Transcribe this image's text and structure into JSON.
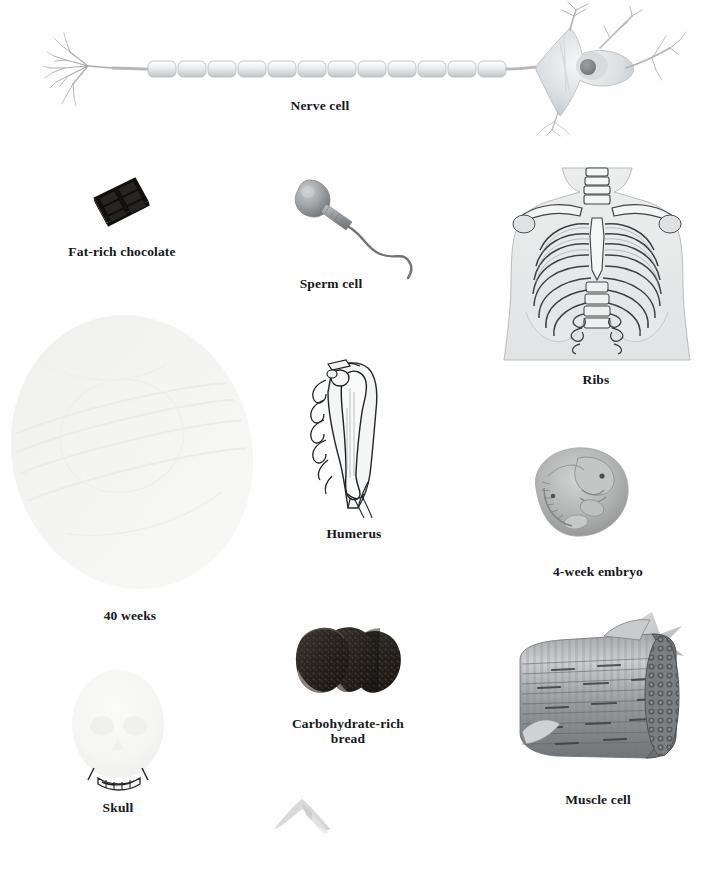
{
  "page": {
    "background_color": "#fefefe",
    "width": 708,
    "height": 878,
    "caption_color": "#15171b"
  },
  "figures": [
    {
      "id": "nerve-cell",
      "name": "nerve-cell-illustration",
      "caption": "Nerve cell",
      "caption_lines": [
        "Nerve cell"
      ],
      "subject": "myelinated neuron with dendrites, axon and soma",
      "color": "#b9bcc0"
    },
    {
      "id": "chocolate",
      "name": "fat-rich-chocolate-illustration",
      "caption": "Fat-rich chocolate",
      "caption_lines": [
        "Fat-rich chocolate"
      ],
      "subject": "dark chocolate bar of six squares",
      "color": "#1c1a19"
    },
    {
      "id": "sperm",
      "name": "sperm-cell-illustration",
      "caption": "Sperm cell",
      "caption_lines": [
        "Sperm cell"
      ],
      "subject": "spermatozoon with head, midpiece and flagellum",
      "color": "#8d9094"
    },
    {
      "id": "ribs",
      "name": "ribs-illustration",
      "caption": "Ribs",
      "caption_lines": [
        "Ribs"
      ],
      "subject": "anterior view of human rib cage and thorax",
      "color": "#6f7377"
    },
    {
      "id": "fetus40",
      "name": "forty-weeks-fetus-illustration",
      "caption": "40 weeks",
      "caption_lines": [
        "40 weeks"
      ],
      "subject": "faint full-term fetus in uterus, very light grey oval",
      "color": "#f2f2f1"
    },
    {
      "id": "humerus",
      "name": "humerus-illustration",
      "caption": "Humerus",
      "caption_lines": [
        "Humerus"
      ],
      "subject": "upper arm bone within arm outline",
      "color": "#3a3c3f"
    },
    {
      "id": "embryo",
      "name": "four-week-embryo-illustration",
      "caption": "4-week embryo",
      "caption_lines": [
        "4-week embryo"
      ],
      "subject": "curled four week old human embryo",
      "color": "#9a9c9d"
    },
    {
      "id": "skull",
      "name": "skull-illustration",
      "caption": "Skull",
      "caption_lines": [
        "Skull"
      ],
      "subject": "faint human skull, pale oval with dark teeth at base",
      "color": "#f4f4f3"
    },
    {
      "id": "bread",
      "name": "carbohydrate-rich-bread-illustration",
      "caption": "Carbohydrate-rich\nbread",
      "caption_lines": [
        "Carbohydrate-rich",
        "bread"
      ],
      "subject": "three dark slices of rye bread",
      "color": "#2a2724"
    },
    {
      "id": "muscle",
      "name": "muscle-cell-illustration",
      "caption": "Muscle cell",
      "caption_lines": [
        "Muscle cell"
      ],
      "subject": "cut-away cylinder of striated muscle fibre with myofibrils",
      "color": "#8b8e91"
    }
  ],
  "decorations": [
    {
      "id": "star",
      "name": "grey-star-decoration",
      "color": "#b5b7b9"
    },
    {
      "id": "chevron",
      "name": "faint-chevron-artifact",
      "color": "#d9dadb"
    }
  ],
  "captions": {
    "nerve_cell": "Nerve cell",
    "chocolate": "Fat-rich chocolate",
    "sperm": "Sperm cell",
    "ribs": "Ribs",
    "weeks40": "40 weeks",
    "humerus": "Humerus",
    "embryo": "4-week embryo",
    "skull": "Skull",
    "bread_line1": "Carbohydrate-rich",
    "bread_line2": "bread",
    "muscle": "Muscle cell"
  }
}
